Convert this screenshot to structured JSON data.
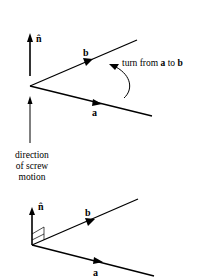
{
  "top_diagram": {
    "normal_label": "n̂",
    "vector_b_label": "b",
    "vector_a_label": "a",
    "turn_annotation": {
      "prefix": "turn from ",
      "from": "a",
      "middle": " to ",
      "to": "b"
    },
    "screw_label_lines": [
      "direction",
      "of screw",
      "motion"
    ]
  },
  "bottom_diagram": {
    "normal_label": "n̂",
    "vector_b_label": "b",
    "vector_a_label": "a"
  },
  "colors": {
    "stroke": "#000000",
    "background": "#ffffff"
  }
}
